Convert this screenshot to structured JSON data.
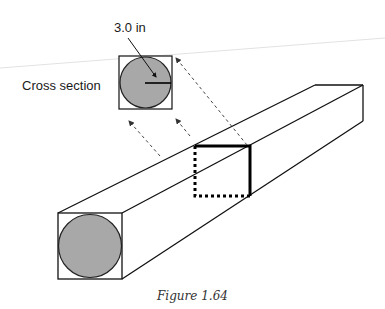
{
  "figure": {
    "caption": "Figure 1.64",
    "cross_section_label": "Cross section",
    "dimension_label": "3.0 in",
    "colors": {
      "stroke": "#111111",
      "circle_fill": "#a8a8a8",
      "faint_line": "#e2e2e2",
      "dashed_arrow": "#444444"
    },
    "elements": [
      "square bar in isometric view with circular inscribed cross-section at front face",
      "middle section highlighted with bold solid and dotted edges",
      "detached cross-section inset with radius dimension",
      "three dashed projection arrows from middle section to inset"
    ]
  }
}
